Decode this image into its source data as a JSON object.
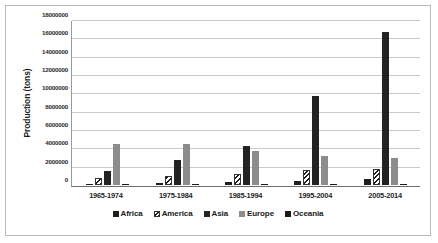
{
  "chart_data": {
    "type": "bar",
    "title": "",
    "subtitle": "",
    "xlabel": "",
    "ylabel": "Production (tons)",
    "categories": [
      "1965-1974",
      "1975-1984",
      "1985-1994",
      "1995-2004",
      "2005-2014"
    ],
    "series": [
      {
        "name": "Africa",
        "color": "#1f1f1f",
        "fill": "solid-black",
        "values": [
          90000,
          180000,
          310000,
          450000,
          640000
        ]
      },
      {
        "name": "America",
        "color": "#1c1c1c",
        "fill": "diagonal-hatch",
        "values": [
          800000,
          950000,
          1250000,
          1600000,
          1800000
        ]
      },
      {
        "name": "Asia",
        "color": "#232323",
        "fill": "solid-black",
        "values": [
          1550000,
          2750000,
          4300000,
          9800000,
          16750000
        ]
      },
      {
        "name": "Europe",
        "color": "#8c8c8c",
        "fill": "solid-gray",
        "values": [
          4500000,
          4450000,
          3700000,
          3150000,
          3000000
        ]
      },
      {
        "name": "Oceania",
        "color": "#1a1a1a",
        "fill": "solid-black",
        "values": [
          110000,
          110000,
          120000,
          120000,
          110000
        ]
      }
    ],
    "ylim": [
      0,
      18000000
    ],
    "ytick_values": [
      0,
      2000000,
      4000000,
      6000000,
      8000000,
      10000000,
      12000000,
      14000000,
      16000000,
      18000000
    ],
    "ytick_labels": [
      "0",
      "2000000",
      "4000000",
      "6000000",
      "8000000",
      "10000000",
      "12000000",
      "14000000",
      "16000000",
      "18000000"
    ],
    "grid": true,
    "grid_axis": "y",
    "legend": true,
    "legend_position": "bottom"
  }
}
